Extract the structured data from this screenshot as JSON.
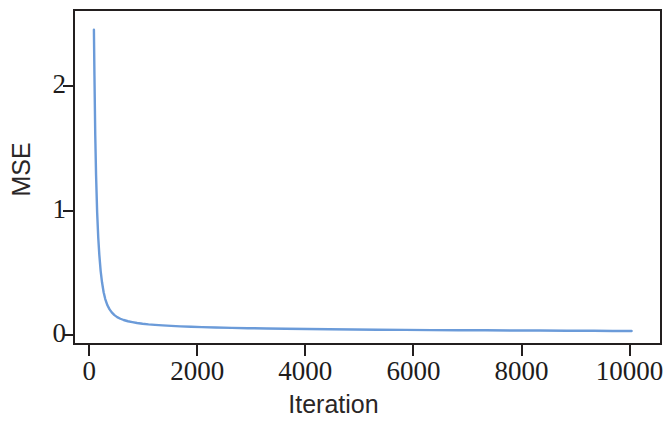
{
  "chart_data": {
    "type": "line",
    "title": "",
    "subtitle": "",
    "xlabel": "Iteration",
    "ylabel": "MSE",
    "xlim": [
      -300,
      10600
    ],
    "ylim": [
      -0.08,
      2.62
    ],
    "xticks": [
      0,
      2000,
      4000,
      6000,
      8000,
      10000
    ],
    "xtick_labels": [
      "0",
      "2000",
      "4000",
      "6000",
      "8000",
      "10000"
    ],
    "yticks": [
      0,
      1,
      2
    ],
    "ytick_labels": [
      "0",
      "1",
      "2"
    ],
    "grid": false,
    "legend": null,
    "annotations": [],
    "series": [
      {
        "name": "MSE",
        "color": "#6b9bd9",
        "linewidth": 2.4,
        "x": [
          50,
          60,
          75,
          90,
          110,
          130,
          150,
          175,
          200,
          230,
          260,
          300,
          340,
          380,
          430,
          480,
          540,
          600,
          680,
          760,
          850,
          950,
          1060,
          1180,
          1320,
          1480,
          1650,
          1850,
          2050,
          2300,
          2600,
          2900,
          3250,
          3600,
          4000,
          4400,
          4850,
          5300,
          5800,
          6300,
          6800,
          7300,
          7800,
          8300,
          8800,
          9300,
          9650,
          10000
        ],
        "y": [
          2.47,
          2.1,
          1.62,
          1.3,
          1.0,
          0.8,
          0.66,
          0.53,
          0.44,
          0.36,
          0.305,
          0.255,
          0.222,
          0.198,
          0.176,
          0.16,
          0.147,
          0.137,
          0.127,
          0.12,
          0.113,
          0.107,
          0.102,
          0.098,
          0.094,
          0.09,
          0.086,
          0.083,
          0.08,
          0.077,
          0.074,
          0.071,
          0.069,
          0.067,
          0.065,
          0.063,
          0.061,
          0.059,
          0.058,
          0.056,
          0.055,
          0.054,
          0.053,
          0.052,
          0.051,
          0.05,
          0.049,
          0.048
        ]
      }
    ],
    "axis_color": "#231f1f",
    "background": "#ffffff"
  },
  "figure": {
    "xlabel": "Iteration",
    "ylabel": "MSE"
  }
}
